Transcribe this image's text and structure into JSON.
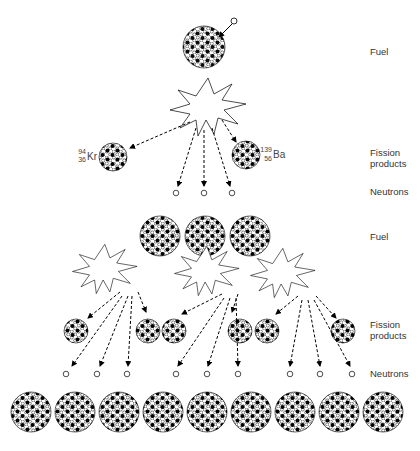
{
  "labels": {
    "fuel_1": "Fuel",
    "fission_1": "Fission\nproducts",
    "neutrons_1": "Neutrons",
    "fuel_2": "Fuel",
    "fission_2": "Fission\nproducts",
    "neutrons_2": "Neutrons"
  },
  "isotopes": {
    "kr": {
      "mass": "94",
      "atomic": "36",
      "symbol": "Kr"
    },
    "ba": {
      "mass": "139",
      "atomic": "56",
      "symbol": "Ba"
    }
  },
  "colors": {
    "ink": "#000000",
    "text": "#333333",
    "background": "#ffffff"
  }
}
